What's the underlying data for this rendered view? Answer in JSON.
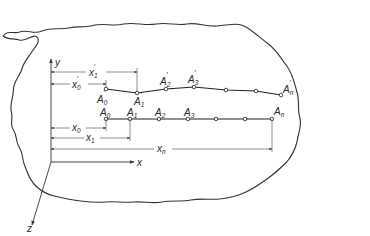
{
  "diagram": {
    "axes": {
      "x_label": "x",
      "y_label": "y",
      "z_label": "z"
    },
    "original_points": {
      "labels": [
        "A",
        "A",
        "A",
        "A",
        "A"
      ],
      "subscripts": [
        "0",
        "1",
        "2",
        "3",
        "n"
      ],
      "count_shown": 7
    },
    "displaced_points": {
      "labels": [
        "A",
        "A",
        "A",
        "A",
        "A"
      ],
      "subscripts": [
        "0",
        "1",
        "2",
        "3",
        "n"
      ],
      "prime": "′",
      "count_shown": 7
    },
    "dimensions": [
      {
        "name": "x1-prime",
        "label": "x",
        "sub": "1",
        "prime": "′"
      },
      {
        "name": "x0-prime",
        "label": "x",
        "sub": "0",
        "prime": "′"
      },
      {
        "name": "x0",
        "label": "x",
        "sub": "0"
      },
      {
        "name": "x1",
        "label": "x",
        "sub": "1"
      },
      {
        "name": "xn",
        "label": "x",
        "sub": "n"
      }
    ]
  }
}
